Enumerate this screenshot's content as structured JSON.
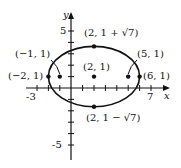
{
  "diagram": {
    "type": "ellipse-graph",
    "center": {
      "x": 2,
      "y": 1,
      "label": "(2, 1)"
    },
    "axes": {
      "x_label": "x",
      "y_label": "y",
      "x_ticks": {
        "labeled": [
          "-3",
          "7"
        ]
      },
      "y_ticks": {
        "labeled": [
          "5",
          "-5"
        ]
      }
    },
    "points": [
      {
        "id": "top-vertex",
        "label": "(2, 1 + √7)"
      },
      {
        "id": "bottom-vertex",
        "label": "(2, 1 − √7)"
      },
      {
        "id": "left-vertex",
        "label": "(−2, 1)"
      },
      {
        "id": "right-vertex",
        "label": "(6, 1)"
      },
      {
        "id": "left-focus",
        "label": "(−1, 1)"
      },
      {
        "id": "right-focus",
        "label": "(5, 1)"
      },
      {
        "id": "center",
        "label": "(2, 1)"
      }
    ],
    "color": "#111111"
  }
}
